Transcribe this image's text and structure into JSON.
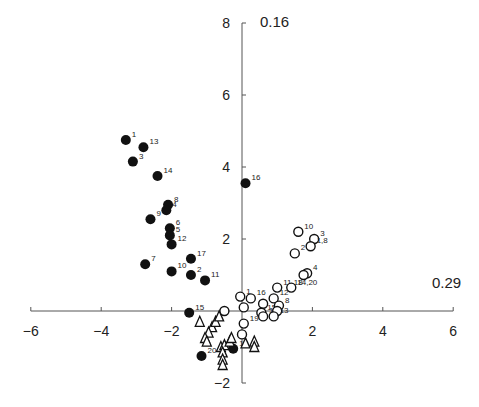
{
  "chart_data": {
    "type": "scatter",
    "title": "",
    "xlabel": "0.29",
    "ylabel": "0.16",
    "xlim": [
      -6,
      6
    ],
    "ylim": [
      -2,
      8
    ],
    "x_ticks": [
      -6,
      -4,
      -2,
      2,
      4,
      6
    ],
    "y_ticks": [
      -2,
      2,
      4,
      6,
      8
    ],
    "grid": false,
    "legend": null,
    "series": [
      {
        "name": "filled-circles",
        "marker": "filled-circle",
        "points": [
          {
            "label": "1",
            "x": -3.3,
            "y": 4.75
          },
          {
            "label": "13",
            "x": -2.8,
            "y": 4.55
          },
          {
            "label": "3",
            "x": -3.1,
            "y": 4.15
          },
          {
            "label": "14",
            "x": -2.4,
            "y": 3.75
          },
          {
            "label": "16",
            "x": 0.1,
            "y": 3.55
          },
          {
            "label": "8",
            "x": -2.1,
            "y": 2.95
          },
          {
            "label": "4",
            "x": -2.15,
            "y": 2.8
          },
          {
            "label": "9",
            "x": -2.6,
            "y": 2.55
          },
          {
            "label": "6",
            "x": -2.05,
            "y": 2.3
          },
          {
            "label": "5",
            "x": -2.05,
            "y": 2.1
          },
          {
            "label": "12",
            "x": -2.0,
            "y": 1.85
          },
          {
            "label": "17",
            "x": -1.45,
            "y": 1.45
          },
          {
            "label": "7",
            "x": -2.75,
            "y": 1.3
          },
          {
            "label": "10",
            "x": -2.0,
            "y": 1.1
          },
          {
            "label": "2",
            "x": -1.45,
            "y": 1.0
          },
          {
            "label": "11",
            "x": -1.05,
            "y": 0.85
          },
          {
            "label": "15",
            "x": -1.5,
            "y": -0.05
          },
          {
            "label": "20",
            "x": -1.15,
            "y": -1.25
          },
          {
            "label": "18",
            "x": -0.25,
            "y": -1.05
          }
        ]
      },
      {
        "name": "open-circles",
        "marker": "open-circle",
        "points": [
          {
            "label": "10",
            "x": 1.6,
            "y": 2.2
          },
          {
            "label": "3",
            "x": 2.05,
            "y": 2.0
          },
          {
            "label": "1,8",
            "x": 1.95,
            "y": 1.8
          },
          {
            "label": "2",
            "x": 1.5,
            "y": 1.6
          },
          {
            "label": "4",
            "x": 1.85,
            "y": 1.05
          },
          {
            "label": "",
            "x": 1.75,
            "y": 1.0
          },
          {
            "label": "11,18",
            "x": 1.0,
            "y": 0.65
          },
          {
            "label": "14,20",
            "x": 1.4,
            "y": 0.65
          },
          {
            "label": "16",
            "x": 0.25,
            "y": 0.35
          },
          {
            "label": "9",
            "x": 0.6,
            "y": 0.2
          },
          {
            "label": "12",
            "x": 0.9,
            "y": 0.35
          },
          {
            "label": "1",
            "x": -0.05,
            "y": 0.4
          },
          {
            "label": "",
            "x": 0.05,
            "y": 0.1
          },
          {
            "label": "15",
            "x": 0.55,
            "y": -0.05
          },
          {
            "label": "17",
            "x": 0.6,
            "y": -0.15
          },
          {
            "label": "8",
            "x": 1.05,
            "y": 0.15
          },
          {
            "label": "",
            "x": 1.0,
            "y": 0.0
          },
          {
            "label": "13",
            "x": 0.9,
            "y": -0.15
          },
          {
            "label": "",
            "x": -0.5,
            "y": 0.0
          },
          {
            "label": "19",
            "x": 0.05,
            "y": -0.35
          },
          {
            "label": "",
            "x": 0.0,
            "y": -0.65
          }
        ]
      },
      {
        "name": "open-triangles",
        "marker": "open-triangle",
        "points": [
          {
            "x": -1.2,
            "y": -0.3
          },
          {
            "x": -0.85,
            "y": -0.45
          },
          {
            "x": -0.75,
            "y": -0.3
          },
          {
            "x": -0.65,
            "y": -0.15
          },
          {
            "x": -0.95,
            "y": -0.6
          },
          {
            "x": -1.05,
            "y": -0.75
          },
          {
            "x": -1.0,
            "y": -0.85
          },
          {
            "x": -0.6,
            "y": -1.0
          },
          {
            "x": -0.5,
            "y": -0.95
          },
          {
            "x": -0.35,
            "y": -0.85
          },
          {
            "x": -0.3,
            "y": -0.75
          },
          {
            "x": -0.55,
            "y": -1.15
          },
          {
            "x": -0.55,
            "y": -1.35
          },
          {
            "x": -0.55,
            "y": -1.5
          },
          {
            "x": 0.1,
            "y": -0.9
          },
          {
            "x": 0.35,
            "y": -0.85
          },
          {
            "x": 0.35,
            "y": -1.0
          }
        ]
      }
    ]
  }
}
